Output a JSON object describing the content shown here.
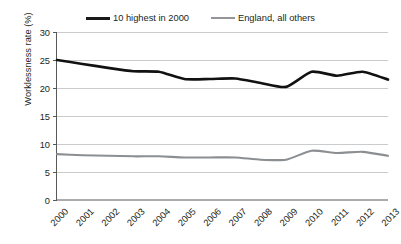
{
  "chart_data": {
    "type": "line",
    "title": "",
    "xlabel": "",
    "ylabel": "Worklessness rate (%)",
    "ylim": [
      0,
      30
    ],
    "yticks": [
      0,
      5,
      10,
      15,
      20,
      25,
      30
    ],
    "ytick_labels": [
      "0",
      "5",
      "10",
      "15",
      "20",
      "25",
      "30"
    ],
    "grid": true,
    "legend_position": "top-center",
    "categories": [
      2000,
      2001,
      2002,
      2003,
      2004,
      2005,
      2006,
      2007,
      2008,
      2009,
      2010,
      2011,
      2012,
      2013
    ],
    "xtick_labels": [
      "2000",
      "2001",
      "2002",
      "2003",
      "2004",
      "2005",
      "2006",
      "2007",
      "2008",
      "2009",
      "2010",
      "2011",
      "2012",
      "2013"
    ],
    "series": [
      {
        "name": "10 highest in 2000",
        "color": "#111111",
        "values": [
          25.0,
          24.3,
          23.6,
          23.0,
          22.9,
          21.6,
          21.6,
          21.7,
          20.9,
          20.2,
          22.9,
          22.2,
          22.9,
          21.5
        ]
      },
      {
        "name": "England, all others",
        "color": "#8c8f92",
        "values": [
          8.2,
          8.0,
          7.9,
          7.8,
          7.8,
          7.6,
          7.6,
          7.6,
          7.2,
          7.2,
          8.8,
          8.4,
          8.6,
          7.9
        ]
      }
    ]
  },
  "legend": {
    "items": [
      {
        "label": "10 highest in 2000",
        "swatch": "series-dark"
      },
      {
        "label": "England, all others",
        "swatch": "series-gray"
      }
    ]
  },
  "axes": {
    "y_axis_title": "Worklessness rate (%)"
  }
}
